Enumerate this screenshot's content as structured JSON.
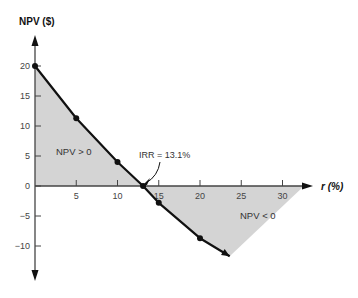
{
  "chart_data": {
    "type": "line",
    "title": "",
    "ylabel": "NPV ($)",
    "xlabel": "r (%)",
    "xlim": [
      0,
      33
    ],
    "ylim": [
      -14,
      24
    ],
    "x_ticks": [
      5,
      10,
      15,
      20,
      25,
      30
    ],
    "x_tick_labels": [
      "5",
      "10",
      "15",
      "20",
      "25",
      "30"
    ],
    "y_ticks": [
      20,
      15,
      10,
      5,
      0,
      -5,
      -10
    ],
    "y_tick_labels": [
      "20",
      "15",
      "10",
      "5",
      "0",
      "−5",
      "−10"
    ],
    "grid": false,
    "series": [
      {
        "name": "NPV profile",
        "x": [
          0,
          5,
          10,
          13.1,
          15,
          20
        ],
        "values": [
          20,
          11.3,
          4.0,
          0,
          -2.8,
          -8.7
        ],
        "curve_end": {
          "x": 23.6,
          "y": -11.7
        },
        "color": "#111111"
      }
    ],
    "shaded_regions": [
      {
        "label": "NPV > 0",
        "fill": "#d4d4d4"
      },
      {
        "label": "NPV < 0",
        "fill": "#d4d4d4",
        "right_x": 32.6
      }
    ],
    "annotations": [
      {
        "text": "IRR = 13.1%",
        "x": 13.1,
        "y": 0
      }
    ]
  }
}
